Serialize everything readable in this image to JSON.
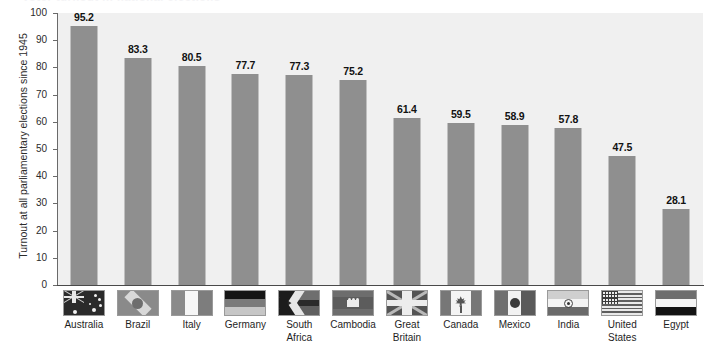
{
  "header": {
    "clipped_title": "Voter turnout in national elections"
  },
  "chart_data": {
    "type": "bar",
    "title": "",
    "xlabel": "",
    "ylabel": "Turnout at all parliamentary elections since 1945",
    "ylim": [
      0,
      100
    ],
    "ytick_labels": [
      "0",
      "10",
      "20",
      "30",
      "40",
      "50",
      "60",
      "70",
      "80",
      "90",
      "100"
    ],
    "ytick_values": [
      0,
      10,
      20,
      30,
      40,
      50,
      60,
      70,
      80,
      90,
      100
    ],
    "grid": false,
    "legend": "none",
    "categories": [
      "Australia",
      "Brazil",
      "Italy",
      "Germany",
      "South Africa",
      "Cambodia",
      "Great Britain",
      "Canada",
      "Mexico",
      "India",
      "United States",
      "Egypt"
    ],
    "category_lines": [
      [
        "Australia"
      ],
      [
        "Brazil"
      ],
      [
        "Italy"
      ],
      [
        "Germany"
      ],
      [
        "South",
        "Africa"
      ],
      [
        "Cambodia"
      ],
      [
        "Great",
        "Britain"
      ],
      [
        "Canada"
      ],
      [
        "Mexico"
      ],
      [
        "India"
      ],
      [
        "United",
        "States"
      ],
      [
        "Egypt"
      ]
    ],
    "values": [
      95.2,
      83.3,
      80.5,
      77.7,
      77.3,
      75.2,
      61.4,
      59.5,
      58.9,
      57.8,
      47.5,
      28.1
    ],
    "value_labels": [
      "95.2",
      "83.3",
      "80.5",
      "77.7",
      "77.3",
      "75.2",
      "61.4",
      "59.5",
      "58.9",
      "57.8",
      "47.5",
      "28.1"
    ],
    "flag_icons": [
      "flag-australia-icon",
      "flag-brazil-icon",
      "flag-italy-icon",
      "flag-germany-icon",
      "flag-south-africa-icon",
      "flag-cambodia-icon",
      "flag-great-britain-icon",
      "flag-canada-icon",
      "flag-mexico-icon",
      "flag-india-icon",
      "flag-united-states-icon",
      "flag-egypt-icon"
    ]
  },
  "colors": {
    "bar": "#8f8f8f",
    "plot_background": "#f0f0f0",
    "page_background": "#ffffff",
    "axis": "#4a4a4a",
    "text": "#1a1a1a"
  }
}
